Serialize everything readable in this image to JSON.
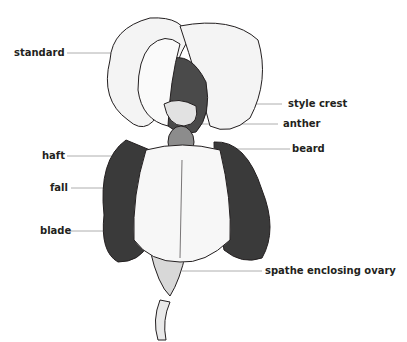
{
  "diagram": {
    "labels": {
      "standard": "standard",
      "style_crest": "style crest",
      "anther": "anther",
      "haft": "haft",
      "beard": "beard",
      "fall": "fall",
      "blade": "blade",
      "spathe": "spathe enclosing ovary"
    },
    "colors": {
      "ink": "#231f20",
      "leader": "#9a9a9a",
      "background": "#ffffff"
    }
  }
}
